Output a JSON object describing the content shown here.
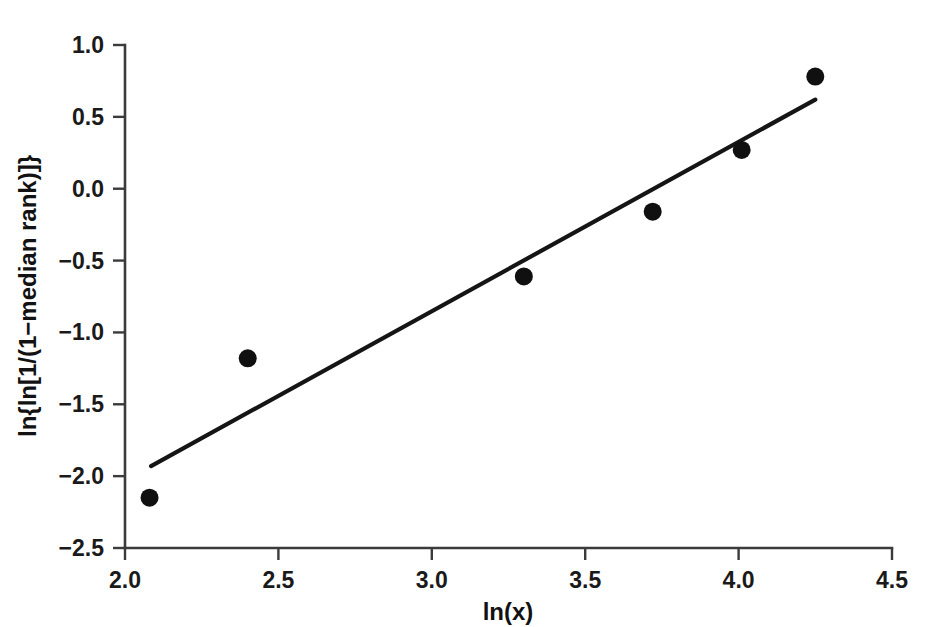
{
  "chart_data": {
    "type": "scatter",
    "title": "",
    "subtitle": "",
    "xlabel": "ln(x)",
    "ylabel": "ln{ln[1/(1−median rank)]}",
    "xlim": [
      2.0,
      4.5
    ],
    "ylim": [
      -2.5,
      1.0
    ],
    "xticks": [
      2.0,
      2.5,
      3.0,
      3.5,
      4.0,
      4.5
    ],
    "xtick_labels": [
      "2.0",
      "2.5",
      "3.0",
      "3.5",
      "4.0",
      "4.5"
    ],
    "yticks": [
      -2.5,
      -2.0,
      -1.5,
      -1.0,
      -0.5,
      0.0,
      0.5,
      1.0
    ],
    "ytick_labels": [
      "−2.5",
      "−2.0",
      "−1.5",
      "−1.0",
      "−0.5",
      "0.0",
      "0.5",
      "1.0"
    ],
    "grid": false,
    "legend": false,
    "legend_position": "none",
    "series": [
      {
        "name": "median rank data",
        "marker": "filled-circle",
        "marker_color": "#101010",
        "marker_size": 9,
        "x": [
          2.08,
          2.4,
          3.3,
          3.72,
          4.01,
          4.25
        ],
        "y": [
          -2.15,
          -1.18,
          -0.61,
          -0.16,
          0.27,
          0.78
        ]
      }
    ],
    "annotations": [],
    "fit_line": {
      "name": "least-squares fit",
      "type": "line",
      "color": "#151515",
      "x": [
        2.085,
        4.25
      ],
      "y": [
        -1.93,
        0.62
      ],
      "slope": 1.18,
      "intercept": -4.39
    }
  },
  "axes": {
    "x_title": "ln(x)",
    "y_title": "ln{ln[1/(1−median rank)]}"
  },
  "ticks": {
    "x": [
      "2.0",
      "2.5",
      "3.0",
      "3.5",
      "4.0",
      "4.5"
    ],
    "y": [
      "1.0",
      "0.5",
      "0.0",
      "−0.5",
      "−1.0",
      "−1.5",
      "−2.0",
      "−2.5"
    ]
  }
}
